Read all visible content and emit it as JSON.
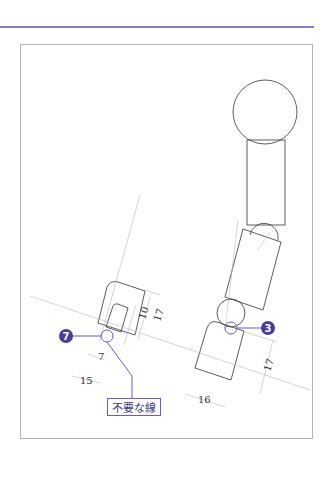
{
  "diagram": {
    "callout_label": "不要な線",
    "markers": [
      {
        "number": "7",
        "color": "#4b3a9e"
      },
      {
        "number": "3",
        "color": "#4b3a9e"
      }
    ],
    "dimensions": {
      "left_part": [
        "7",
        "15",
        "10",
        "17"
      ],
      "right_part": [
        "16",
        "17"
      ]
    },
    "colors": {
      "accent": "#8a7cc4",
      "marker": "#4b3a9e",
      "line": "#333333",
      "centerline": "#b8b8b8",
      "frame": "#b4b4b4"
    }
  }
}
